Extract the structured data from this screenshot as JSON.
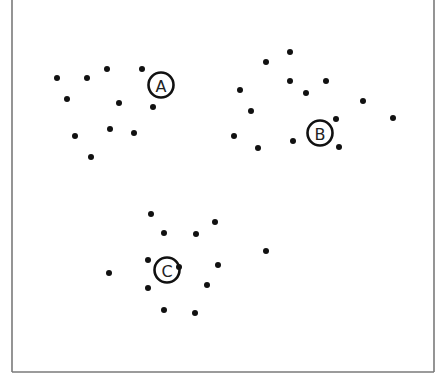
{
  "diagram": {
    "type": "cluster-scatter",
    "frame": {
      "left": 12,
      "right": 434,
      "bottom": 372,
      "top_open": true,
      "color": "#7a7a7a"
    },
    "colors": {
      "point": "#111111",
      "ring": "#111111",
      "label": "#222222",
      "background": "#ffffff"
    },
    "point_radius": 3,
    "centroid_radius": 12.5,
    "clusters": [
      {
        "name": "A",
        "centroid": {
          "label": "A",
          "x": 161,
          "y": 85
        },
        "points": [
          {
            "x": 57,
            "y": 78
          },
          {
            "x": 87,
            "y": 78
          },
          {
            "x": 107,
            "y": 69
          },
          {
            "x": 142,
            "y": 69
          },
          {
            "x": 67,
            "y": 99
          },
          {
            "x": 119,
            "y": 103
          },
          {
            "x": 153,
            "y": 107
          },
          {
            "x": 75,
            "y": 136
          },
          {
            "x": 110,
            "y": 129
          },
          {
            "x": 134,
            "y": 133
          },
          {
            "x": 91,
            "y": 157
          }
        ]
      },
      {
        "name": "B",
        "centroid": {
          "label": "B",
          "x": 320,
          "y": 133
        },
        "points": [
          {
            "x": 290,
            "y": 52
          },
          {
            "x": 266,
            "y": 62
          },
          {
            "x": 290,
            "y": 81
          },
          {
            "x": 326,
            "y": 81
          },
          {
            "x": 240,
            "y": 90
          },
          {
            "x": 306,
            "y": 93
          },
          {
            "x": 363,
            "y": 101
          },
          {
            "x": 251,
            "y": 111
          },
          {
            "x": 393,
            "y": 118
          },
          {
            "x": 336,
            "y": 119
          },
          {
            "x": 234,
            "y": 136
          },
          {
            "x": 293,
            "y": 141
          },
          {
            "x": 258,
            "y": 148
          },
          {
            "x": 339,
            "y": 147
          }
        ]
      },
      {
        "name": "C",
        "centroid": {
          "label": "C",
          "x": 167,
          "y": 270
        },
        "points": [
          {
            "x": 151,
            "y": 214
          },
          {
            "x": 215,
            "y": 222
          },
          {
            "x": 164,
            "y": 233
          },
          {
            "x": 196,
            "y": 234
          },
          {
            "x": 266,
            "y": 251
          },
          {
            "x": 148,
            "y": 260
          },
          {
            "x": 218,
            "y": 265
          },
          {
            "x": 179,
            "y": 267
          },
          {
            "x": 109,
            "y": 273
          },
          {
            "x": 207,
            "y": 285
          },
          {
            "x": 148,
            "y": 288
          },
          {
            "x": 164,
            "y": 310
          },
          {
            "x": 195,
            "y": 313
          }
        ]
      }
    ]
  }
}
